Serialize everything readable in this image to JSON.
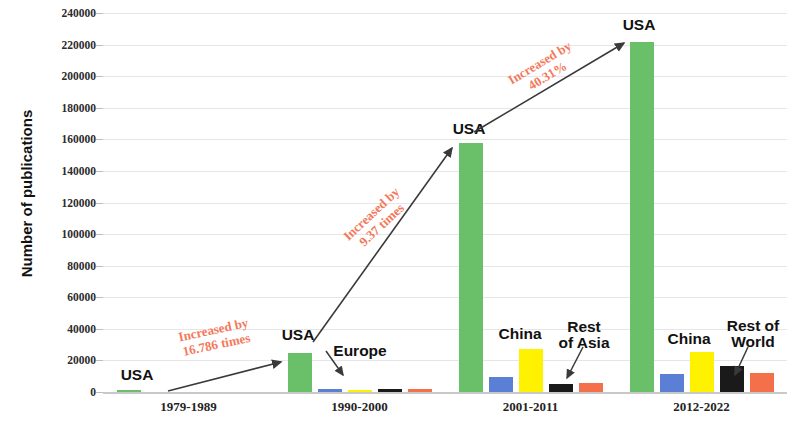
{
  "chart_data": {
    "type": "bar",
    "title": "",
    "subtitle": "",
    "xlabel": "",
    "ylabel": "Number of publications",
    "ylim": [
      0,
      240000
    ],
    "ytick_step": 20000,
    "yticks": [
      240000,
      220000,
      200000,
      180000,
      160000,
      140000,
      120000,
      100000,
      80000,
      60000,
      40000,
      20000,
      0
    ],
    "ytick_labels": [
      "240000",
      "220000",
      "200000",
      "180000",
      "160000",
      "140000",
      "120000",
      "100000",
      "80000",
      "60000",
      "40000",
      "20000",
      "0"
    ],
    "grid": true,
    "legend": null,
    "legend_position": "none",
    "categories": [
      "1979-1989",
      "1990-2000",
      "2001-2011",
      "2012-2022"
    ],
    "series": [
      {
        "name": "USA",
        "color": "#6ABF69",
        "values": [
          1400,
          25000,
          158000,
          221600
        ]
      },
      {
        "name": "Europe",
        "color": "#5B7FD4",
        "values": [
          0,
          2100,
          9500,
          11500
        ]
      },
      {
        "name": "China",
        "color": "#FFF200",
        "values": [
          0,
          1500,
          27500,
          25500
        ]
      },
      {
        "name": "Rest of Asia",
        "color": "#1A1A1A",
        "values": [
          0,
          2000,
          5200,
          16500
        ]
      },
      {
        "name": "Rest of World",
        "color": "#F4704A",
        "values": [
          0,
          2200,
          6000,
          11800
        ]
      }
    ],
    "annotations": [
      {
        "text": "Increased by\n16.786 times",
        "value": "16.786 times",
        "from": "1979-1989",
        "to": "1990-2000",
        "color": "#F4795B"
      },
      {
        "text": "Increased by\n9.37 times",
        "value": "9.37 times",
        "from": "1990-2000",
        "to": "2001-2011",
        "color": "#F4795B"
      },
      {
        "text": "Increased by\n40.31%",
        "value": "40.31%",
        "from": "2001-2011",
        "to": "2012-2022",
        "color": "#F4795B"
      }
    ],
    "callouts": [
      {
        "label": "USA",
        "group": "1979-1989"
      },
      {
        "label": "USA",
        "group": "1990-2000"
      },
      {
        "label": "Europe",
        "group": "1990-2000"
      },
      {
        "label": "USA",
        "group": "2001-2011"
      },
      {
        "label": "China",
        "group": "2001-2011"
      },
      {
        "label": "Rest\nof Asia",
        "group": "2001-2011"
      },
      {
        "label": "USA",
        "group": "2012-2022"
      },
      {
        "label": "China",
        "group": "2012-2022"
      },
      {
        "label": "Rest of\nWorld",
        "group": "2012-2022"
      }
    ]
  },
  "axis": {
    "y_title": "Number of publications"
  },
  "labels": {
    "group_0": "1979-1989",
    "group_1": "1990-2000",
    "group_2": "2001-2011",
    "group_3": "2012-2022",
    "usa_1": "USA",
    "usa_2": "USA",
    "europe_2": "Europe",
    "usa_3": "USA",
    "china_3": "China",
    "rest_asia_3_line1": "Rest",
    "rest_asia_3_line2": "of Asia",
    "usa_4": "USA",
    "china_4": "China",
    "rest_world_4_line1": "Rest of",
    "rest_world_4_line2": "World",
    "ann_1_line1": "Increased by",
    "ann_1_line2": "16.786 times",
    "ann_2_line1": "Increased by",
    "ann_2_line2": "9.37 times",
    "ann_3_line1": "Increased by",
    "ann_3_line2": "40.31%"
  },
  "colors": {
    "usa": "#6ABF69",
    "europe": "#5B7FD4",
    "china": "#FFF200",
    "rest_of_asia": "#1A1A1A",
    "rest_of_world": "#F4704A",
    "annotation": "#F4795B",
    "gridline": "#e6e6e6",
    "axis_text": "#2b2b2b",
    "background": "#ffffff"
  }
}
